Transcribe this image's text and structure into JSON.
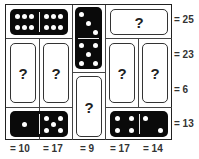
{
  "puzzle": {
    "question_mark": "?",
    "row_sums": [
      "= 25",
      "= 23",
      "= 6",
      "= 13"
    ],
    "col_sums": [
      "= 10",
      "= 17",
      "= 9",
      "= 17",
      "= 14"
    ],
    "known_dominoes": [
      {
        "position": "row1-cols1-2",
        "orientation": "horizontal",
        "values": [
          6,
          6
        ]
      },
      {
        "position": "col3-rows1-2",
        "orientation": "vertical",
        "values": [
          3,
          5
        ]
      },
      {
        "position": "row4-cols1-2",
        "orientation": "horizontal",
        "values": [
          1,
          5
        ]
      },
      {
        "position": "row4-cols4-5",
        "orientation": "horizontal",
        "values": [
          4,
          1
        ]
      }
    ],
    "unknown_dominoes": [
      {
        "position": "row1-cols4-5",
        "orientation": "horizontal"
      },
      {
        "position": "col1-rows2-3",
        "orientation": "vertical"
      },
      {
        "position": "col2-rows2-3",
        "orientation": "vertical"
      },
      {
        "position": "col4-rows2-3",
        "orientation": "vertical"
      },
      {
        "position": "col5-rows2-3",
        "orientation": "vertical"
      },
      {
        "position": "col3-rows3-4",
        "orientation": "vertical"
      }
    ],
    "colors": {
      "domino_black": "#0a0a0a",
      "pip": "#ffffff",
      "grid_line": "#444444",
      "text": "#333333"
    }
  }
}
